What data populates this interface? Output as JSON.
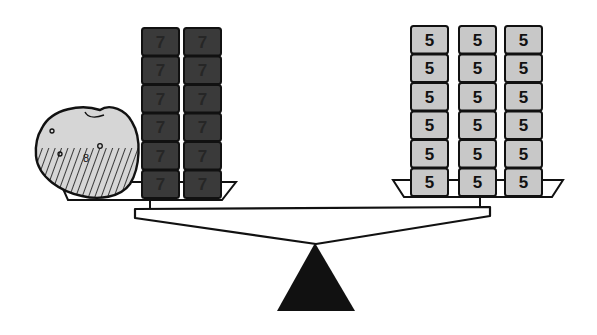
{
  "diagram": {
    "type": "balance-scale",
    "colors": {
      "dark_block": "#3a3a3a",
      "light_block": "#c8c8c8",
      "potato": "#d4d4d4",
      "outline": "#111111",
      "fulcrum": "#111111"
    },
    "left_pan": {
      "object": "potato",
      "potato_label": "8",
      "stacks": [
        {
          "blocks": [
            "7",
            "7",
            "7",
            "7",
            "7",
            "7"
          ]
        },
        {
          "blocks": [
            "7",
            "7",
            "7",
            "7",
            "7",
            "7"
          ]
        }
      ]
    },
    "right_pan": {
      "stacks": [
        {
          "blocks": [
            "5",
            "5",
            "5",
            "5",
            "5",
            "5"
          ]
        },
        {
          "blocks": [
            "5",
            "5",
            "5",
            "5",
            "5",
            "5"
          ]
        },
        {
          "blocks": [
            "5",
            "5",
            "5",
            "5",
            "5",
            "5"
          ]
        }
      ]
    }
  }
}
